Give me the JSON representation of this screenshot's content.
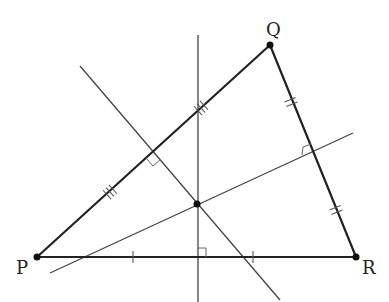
{
  "diagram": {
    "vertices": {
      "P": {
        "label": "P",
        "x": 37,
        "y": 257
      },
      "Q": {
        "label": "Q",
        "x": 270,
        "y": 45
      },
      "R": {
        "label": "R",
        "x": 356,
        "y": 257
      }
    },
    "circumcenter": {
      "x": 197,
      "y": 204
    },
    "bisectors": [
      {
        "name": "perpendicular bisector of PR",
        "x1": 198,
        "y1": 35,
        "x2": 198,
        "y2": 302
      },
      {
        "name": "perpendicular bisector of PQ",
        "x1": 80,
        "y1": 66,
        "x2": 280,
        "y2": 300
      },
      {
        "name": "perpendicular bisector of QR",
        "x1": 50,
        "y1": 273,
        "x2": 353,
        "y2": 133
      }
    ],
    "tick_marks": {
      "PR": "single",
      "PQ": "triple",
      "QR": "double"
    },
    "colors": {
      "line": "#222222",
      "aux": "#444444",
      "background": "#ffffff"
    }
  }
}
